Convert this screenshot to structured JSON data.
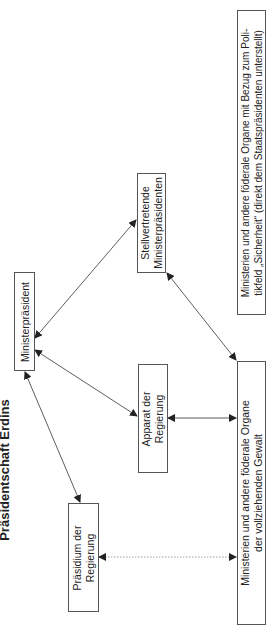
{
  "title": "Präsidentschaft Erdins",
  "nodes": {
    "ministerpraesident": {
      "lines": [
        "Ministerpräsident"
      ]
    },
    "stellvertretende": {
      "lines": [
        "Stellvertretende",
        "Ministerpräsidenten"
      ]
    },
    "apparat": {
      "lines": [
        "Apparat der",
        "Regierung"
      ]
    },
    "praesidium": {
      "lines": [
        "Präsidium der",
        "Regierung"
      ]
    },
    "ministerien_vollziehend": {
      "lines": [
        "Ministerien und andere föderale Organe",
        "der vollziehenden Gewalt"
      ]
    },
    "ministerien_sicherheit": {
      "lines": [
        "Ministerien und andere föderale Organe mit Bezug zum Poli-",
        "tikfeld „Sicherheit“ (direkt dem Staatspräsidenten unterstellt)"
      ]
    }
  },
  "edges": [
    {
      "from": "Ministerpräsident",
      "to": "Stellvertretende Ministerpräsidenten",
      "style": "solid",
      "direction": "both"
    },
    {
      "from": "Ministerpräsident",
      "to": "Apparat der Regierung",
      "style": "solid",
      "direction": "both"
    },
    {
      "from": "Ministerpräsident",
      "to": "Präsidium der Regierung",
      "style": "solid",
      "direction": "both"
    },
    {
      "from": "Stellvertretende Ministerpräsidenten",
      "to": "Ministerien und andere föderale Organe der vollziehenden Gewalt",
      "style": "solid",
      "direction": "both"
    },
    {
      "from": "Apparat der Regierung",
      "to": "Ministerien und andere föderale Organe der vollziehenden Gewalt",
      "style": "solid",
      "direction": "both"
    },
    {
      "from": "Präsidium der Regierung",
      "to": "Ministerien und andere föderale Organe der vollziehenden Gewalt",
      "style": "dotted",
      "direction": "both"
    }
  ]
}
